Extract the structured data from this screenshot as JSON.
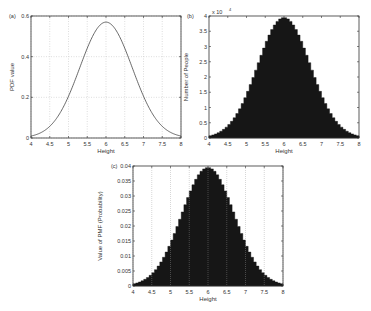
{
  "chart_data": [
    {
      "panel": "(a)",
      "type": "line",
      "title": "",
      "xlabel": "Height",
      "ylabel": "PDF value",
      "xlim": [
        4,
        8
      ],
      "ylim": [
        0,
        0.6
      ],
      "xticks": [
        "4",
        "4.5",
        "5",
        "5.5",
        "6",
        "6.5",
        "7",
        "7.5",
        "8"
      ],
      "yticks": [
        "0",
        "0.2",
        "0.4",
        "0.6"
      ],
      "grid": true,
      "distribution": {
        "mean": 6,
        "sigma": 0.7
      },
      "x": [
        4.0,
        4.5,
        5.0,
        5.5,
        6.0,
        6.5,
        7.0,
        7.5,
        8.0
      ],
      "values": [
        0.0095,
        0.058,
        0.205,
        0.443,
        0.57,
        0.443,
        0.205,
        0.058,
        0.0095
      ]
    },
    {
      "panel": "(b)",
      "type": "bar",
      "title": "",
      "xlabel": "Height",
      "ylabel": "Number of People",
      "y_multiplier": "x 10^4",
      "xlim": [
        4,
        8
      ],
      "ylim": [
        0,
        4
      ],
      "xticks": [
        "4",
        "4.5",
        "5",
        "5.5",
        "6",
        "6.5",
        "7",
        "7.5",
        "8"
      ],
      "yticks": [
        "0",
        "0.5",
        "1",
        "1.5",
        "2",
        "2.5",
        "3",
        "3.5",
        "4"
      ],
      "grid": false,
      "bins": 56,
      "distribution": {
        "mean": 6,
        "sigma": 0.7
      },
      "peak_value": 3.95
    },
    {
      "panel": "(c)",
      "type": "bar",
      "title": "",
      "xlabel": "Height",
      "ylabel": "Value of PMF (Probability)",
      "xlim": [
        4,
        8
      ],
      "ylim": [
        0,
        0.04
      ],
      "xticks": [
        "4",
        "4.5",
        "5",
        "5.5",
        "6",
        "6.5",
        "7",
        "7.5",
        "8"
      ],
      "yticks": [
        "0",
        "0.005",
        "0.01",
        "0.015",
        "0.02",
        "0.025",
        "0.03",
        "0.035",
        "0.04"
      ],
      "grid": true,
      "bins": 56,
      "distribution": {
        "mean": 6,
        "sigma": 0.7
      },
      "peak_value": 0.0395
    }
  ],
  "panels": {
    "a": {
      "tag": "(a)",
      "xlabel": "Height",
      "ylabel": "PDF value"
    },
    "b": {
      "tag": "(b)",
      "xlabel": "Height",
      "ylabel": "Number of People",
      "multiplier": "x 10"
    },
    "c": {
      "tag": "(c)",
      "xlabel": "Height",
      "ylabel": "Value of PMF (Probability)"
    }
  }
}
